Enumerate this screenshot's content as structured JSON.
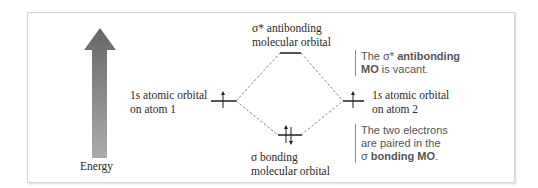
{
  "diagram": {
    "type": "molecular-orbital-energy-diagram",
    "energy_axis": {
      "label": "Energy",
      "gradient_top": "#666666",
      "gradient_bottom": "#ababab"
    },
    "atom1": {
      "line1_prefix": "1",
      "line1_italic": "s",
      "line1_suffix": " atomic orbital",
      "line2": "on atom 1",
      "electrons": "up"
    },
    "atom2": {
      "line1_prefix": "1",
      "line1_italic": "s",
      "line1_suffix": " atomic orbital",
      "line2": "on atom 2",
      "electrons": "up"
    },
    "antibonding": {
      "line1": "σ* antibonding",
      "line2": "molecular orbital",
      "electrons": "none"
    },
    "bonding": {
      "line1": "σ bonding",
      "line2": "molecular orbital",
      "electrons": "up-down"
    },
    "notes": {
      "antibonding": {
        "part1": "The σ* ",
        "bold1": "antibonding",
        "bold2": "MO",
        "part2": " is vacant."
      },
      "bonding": {
        "line1": "The two electrons",
        "line2": "are paired in the",
        "part3": "σ ",
        "bold3": "bonding MO",
        "end": "."
      }
    },
    "colors": {
      "level_line": "#555555",
      "dashed": "#777777",
      "note_text": "#555555",
      "label_text": "#2a2a2a"
    }
  }
}
